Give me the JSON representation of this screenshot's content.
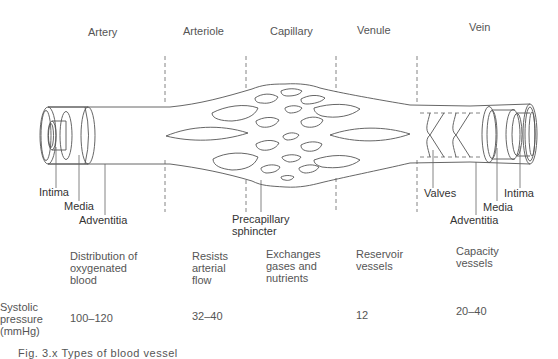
{
  "diagram": {
    "segments": [
      {
        "id": "artery",
        "label": "Artery",
        "function": "Distribution of\noxygenated\nblood",
        "systolic_pressure": "100–120"
      },
      {
        "id": "arteriole",
        "label": "Arteriole",
        "function": "Resists\narterial\nflow",
        "systolic_pressure": "32–40"
      },
      {
        "id": "capillary",
        "label": "Capillary",
        "function": "Exchanges\ngases and\nnutrients",
        "systolic_pressure": ""
      },
      {
        "id": "venule",
        "label": "Venule",
        "function": "Reservoir\nvessels",
        "systolic_pressure": "12"
      },
      {
        "id": "vein",
        "label": "Vein",
        "function": "Capacity\nvessels",
        "systolic_pressure": "20–40"
      }
    ],
    "artery_layers": {
      "intima": "Intima",
      "media": "Media",
      "adventitia": "Adventitia"
    },
    "vein_layers": {
      "valves": "Valves",
      "intima": "Intima",
      "media": "Media",
      "adventitia": "Adventitia"
    },
    "precapillary_label": "Precapillary\nsphincter",
    "row_label": "Systolic\npressure\n(mmHg)",
    "caption_partial": "Fig. 3.x  Types of blood vessel"
  },
  "colors": {
    "line": "#555555",
    "text": "#555555",
    "background": "#ffffff"
  }
}
